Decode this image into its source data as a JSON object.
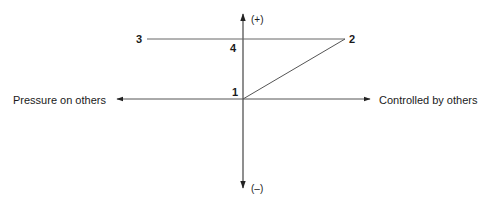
{
  "diagram": {
    "axes": {
      "vertical": {
        "top_label": "(+)",
        "bottom_label": "(–)"
      },
      "horizontal": {
        "left_label": "Pressure on others",
        "right_label": "Controlled by others"
      }
    },
    "points": [
      {
        "id": "1",
        "label": "1"
      },
      {
        "id": "2",
        "label": "2"
      },
      {
        "id": "3",
        "label": "3"
      },
      {
        "id": "4",
        "label": "4"
      }
    ],
    "line_color": "#555555",
    "axis_color": "#333333"
  }
}
